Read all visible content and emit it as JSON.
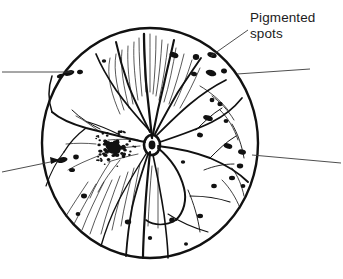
{
  "figure": {
    "name": "retinal-fundus-drawing",
    "title": "",
    "background_color": "#ffffff",
    "ink_color": "#111111"
  },
  "annotations": {
    "pigmented_spots": {
      "line1": "Pigmented",
      "line2": "spots",
      "full_text": "Pigmented spots",
      "x": 250,
      "y": 10,
      "font_size_px": 13.5,
      "color": "#1c1c1c"
    }
  },
  "leader_lines": [
    {
      "name": "leader-pigmented-spots-upper-right",
      "from": [
        248,
        30
      ],
      "to": [
        211,
        56
      ],
      "description": "from Pigmented spots label down-left to spot near upper right rim"
    },
    {
      "name": "leader-right-upper",
      "from": [
        310,
        69
      ],
      "to": [
        237,
        74
      ],
      "description": "near-horizontal leader entering right rim"
    },
    {
      "name": "leader-left-upper",
      "from": [
        2,
        72
      ],
      "to": [
        72,
        72
      ],
      "description": "horizontal leader entering from left edge to upper-left rim spots"
    },
    {
      "name": "leader-left-lower",
      "from": [
        2,
        172
      ],
      "to": [
        60,
        160
      ],
      "description": "diagonal leader from lower-left with arrowhead pointing to pigment spot"
    },
    {
      "name": "leader-right-lower",
      "from": [
        341,
        163
      ],
      "to": [
        252,
        155
      ],
      "description": "diagonal leader exiting to right edge from lower-right rim"
    }
  ],
  "fundus": {
    "name": "fundus-circle",
    "center": [
      150,
      143
    ],
    "radius": 108,
    "outline_color": "#111111",
    "outline_width": 2.4,
    "fill": "#ffffff"
  },
  "optic_disc": {
    "name": "optic-disc",
    "center": [
      152,
      145
    ],
    "radius_x": 9,
    "radius_y": 11,
    "description": "optic nerve head where retinal vessels converge"
  },
  "macula": {
    "name": "macula-stipple",
    "center": [
      114,
      148
    ],
    "radius": 22,
    "description": "dense stippled pigment cluster nasal to the disc",
    "dot_count": 130
  },
  "pigmented_spot_markers": [
    {
      "cx": 69,
      "cy": 73,
      "rx": 5.5,
      "ry": 2.6,
      "rot": -16
    },
    {
      "cx": 80,
      "cy": 72,
      "rx": 3.0,
      "ry": 2.2,
      "rot": -10
    },
    {
      "cx": 60,
      "cy": 76,
      "rx": 3.2,
      "ry": 2.0,
      "rot": -22
    },
    {
      "cx": 104,
      "cy": 61,
      "rx": 2.2,
      "ry": 1.8,
      "rot": 0
    },
    {
      "cx": 174,
      "cy": 55,
      "rx": 4.6,
      "ry": 2.7,
      "rot": 20
    },
    {
      "cx": 196,
      "cy": 57,
      "rx": 3.2,
      "ry": 3.0,
      "rot": 0
    },
    {
      "cx": 194,
      "cy": 74,
      "rx": 3.0,
      "ry": 2.2,
      "rot": 12
    },
    {
      "cx": 212,
      "cy": 55,
      "rx": 4.8,
      "ry": 2.6,
      "rot": 18
    },
    {
      "cx": 211,
      "cy": 73,
      "rx": 5.4,
      "ry": 3.0,
      "rot": 15
    },
    {
      "cx": 224,
      "cy": 71,
      "rx": 3.0,
      "ry": 2.4,
      "rot": 8
    },
    {
      "cx": 212,
      "cy": 100,
      "rx": 2.4,
      "ry": 2.2,
      "rot": 0
    },
    {
      "cx": 220,
      "cy": 104,
      "rx": 2.6,
      "ry": 2.2,
      "rot": 0
    },
    {
      "cx": 208,
      "cy": 118,
      "rx": 5.0,
      "ry": 2.6,
      "rot": 18
    },
    {
      "cx": 226,
      "cy": 121,
      "rx": 2.4,
      "ry": 2.0,
      "rot": 0
    },
    {
      "cx": 200,
      "cy": 135,
      "rx": 3.0,
      "ry": 2.4,
      "rot": 10
    },
    {
      "cx": 228,
      "cy": 146,
      "rx": 4.4,
      "ry": 2.6,
      "rot": 16
    },
    {
      "cx": 242,
      "cy": 152,
      "rx": 4.0,
      "ry": 2.6,
      "rot": 14
    },
    {
      "cx": 240,
      "cy": 166,
      "rx": 3.2,
      "ry": 2.4,
      "rot": 0
    },
    {
      "cx": 232,
      "cy": 178,
      "rx": 3.0,
      "ry": 2.2,
      "rot": 0
    },
    {
      "cx": 214,
      "cy": 186,
      "rx": 2.8,
      "ry": 2.2,
      "rot": 0
    },
    {
      "cx": 62,
      "cy": 160,
      "rx": 5.6,
      "ry": 2.8,
      "rot": -12
    },
    {
      "cx": 76,
      "cy": 157,
      "rx": 2.8,
      "ry": 2.4,
      "rot": 0
    },
    {
      "cx": 72,
      "cy": 170,
      "rx": 3.0,
      "ry": 2.0,
      "rot": 0
    },
    {
      "cx": 84,
      "cy": 196,
      "rx": 3.0,
      "ry": 2.4,
      "rot": 0
    },
    {
      "cx": 78,
      "cy": 214,
      "rx": 2.4,
      "ry": 2.0,
      "rot": 0
    },
    {
      "cx": 128,
      "cy": 222,
      "rx": 3.2,
      "ry": 2.4,
      "rot": 0
    },
    {
      "cx": 172,
      "cy": 220,
      "rx": 2.8,
      "ry": 2.6,
      "rot": 0
    },
    {
      "cx": 200,
      "cy": 216,
      "rx": 3.0,
      "ry": 2.2,
      "rot": 0
    },
    {
      "cx": 150,
      "cy": 238,
      "rx": 2.2,
      "ry": 2.0,
      "rot": 0
    },
    {
      "cx": 186,
      "cy": 244,
      "rx": 2.0,
      "ry": 1.8,
      "rot": 0
    },
    {
      "cx": 243,
      "cy": 186,
      "rx": 2.4,
      "ry": 2.0,
      "rot": 0
    },
    {
      "cx": 183,
      "cy": 162,
      "rx": 2.2,
      "ry": 1.8,
      "rot": 0
    }
  ]
}
